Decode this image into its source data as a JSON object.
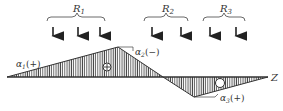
{
  "diagram": {
    "axis_label": "Z",
    "loads": [
      {
        "label": "R",
        "sub": "1",
        "arrows": 3
      },
      {
        "label": "R",
        "sub": "2",
        "arrows": 2
      },
      {
        "label": "R",
        "sub": "3",
        "arrows": 2
      }
    ],
    "angles": [
      {
        "label": "α",
        "sub": "1",
        "sign": "(+)"
      },
      {
        "label": "α",
        "sub": "2",
        "sign": "(−)"
      },
      {
        "label": "α",
        "sub": "3",
        "sign": "(+)"
      }
    ],
    "regions": [
      {
        "sign": "+",
        "symbol": "⊕"
      },
      {
        "sign": "−",
        "symbol": "○"
      }
    ],
    "colors": {
      "line": "#333333",
      "hatch": "#444444",
      "background": "#ffffff"
    }
  }
}
